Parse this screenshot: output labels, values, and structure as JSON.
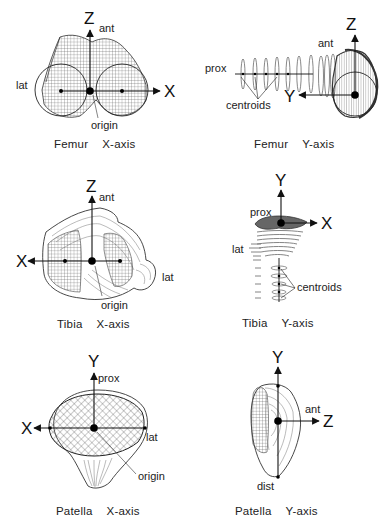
{
  "figure": {
    "panels": [
      {
        "id": "femur-x",
        "caption_bone": "Femur",
        "caption_axis": "X-axis",
        "axis_labels": {
          "vertical": "Z",
          "horizontal": "X"
        },
        "annotations": {
          "top": "ant",
          "side": "lat",
          "origin": "origin"
        }
      },
      {
        "id": "femur-y",
        "caption_bone": "Femur",
        "caption_axis": "Y-axis",
        "axis_labels": {
          "vertical": "Z",
          "horizontal": "Y"
        },
        "annotations": {
          "top": "ant",
          "side": "prox",
          "centroids": "centroids"
        }
      },
      {
        "id": "tibia-x",
        "caption_bone": "Tibia",
        "caption_axis": "X-axis",
        "axis_labels": {
          "vertical": "Z",
          "horizontal": "X"
        },
        "annotations": {
          "top": "ant",
          "side": "lat",
          "origin": "origin"
        }
      },
      {
        "id": "tibia-y",
        "caption_bone": "Tibia",
        "caption_axis": "Y-axis",
        "axis_labels": {
          "vertical": "Y",
          "horizontal": "X"
        },
        "annotations": {
          "top": "prox",
          "side": "lat",
          "centroids": "centroids"
        }
      },
      {
        "id": "patella-x",
        "caption_bone": "Patella",
        "caption_axis": "X-axis",
        "axis_labels": {
          "vertical": "Y",
          "horizontal": "X"
        },
        "annotations": {
          "top": "prox",
          "side": "lat",
          "origin": "origin"
        }
      },
      {
        "id": "patella-y",
        "caption_bone": "Patella",
        "caption_axis": "Y-axis",
        "axis_labels": {
          "vertical": "Y",
          "horizontal": "Z"
        },
        "annotations": {
          "top": "ant",
          "bottom": "dist"
        }
      }
    ]
  }
}
